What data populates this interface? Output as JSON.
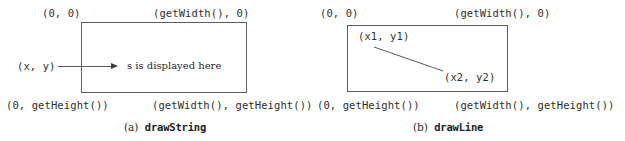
{
  "figure": {
    "background_color": "#ffffff",
    "box_border_color": "#5e5e5e",
    "line_color": "#5a5a5a",
    "text_color": "#2b2b2b"
  },
  "panel_a": {
    "id": "a",
    "caption_index": "(a)",
    "caption_method": "drawString",
    "labels": {
      "top_left": "(0, 0)",
      "top_right": "(getWidth(), 0)",
      "bottom_left": "(0, getHeight())",
      "bottom_right": "(getWidth(), getHeight())",
      "origin_point": "(x, y)",
      "inner_text": "s is displayed here"
    },
    "icons": {
      "arrow": "arrow-right-icon"
    }
  },
  "panel_b": {
    "id": "b",
    "caption_index": "(b)",
    "caption_method": "drawLine",
    "labels": {
      "top_left": "(0, 0)",
      "top_right": "(getWidth(), 0)",
      "bottom_left": "(0, getHeight())",
      "bottom_right": "(getWidth(), getHeight())",
      "point_1": "(x1, y1)",
      "point_2": "(x2, y2)"
    }
  }
}
